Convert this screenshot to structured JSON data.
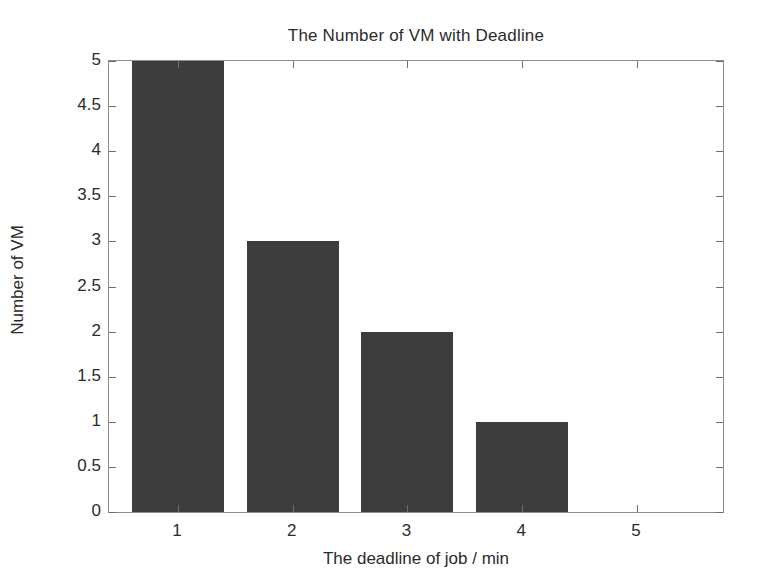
{
  "chart_data": {
    "type": "bar",
    "title": "The Number of VM with Deadline",
    "xlabel": "The deadline of job / min",
    "ylabel": "Number of VM",
    "categories": [
      "1",
      "2",
      "3",
      "4",
      "5"
    ],
    "values": [
      5,
      3,
      2,
      1,
      0
    ],
    "x": [
      1,
      2,
      3,
      4,
      5
    ],
    "xlim": [
      0.4,
      5.75
    ],
    "ylim": [
      0,
      5
    ],
    "y_ticks": [
      0,
      0.5,
      1,
      1.5,
      2,
      2.5,
      3,
      3.5,
      4,
      4.5,
      5
    ],
    "y_tick_labels": [
      "0",
      "0.5",
      "1",
      "1.5",
      "2",
      "2.5",
      "3",
      "3.5",
      "4",
      "4.5",
      "5"
    ],
    "x_ticks": [
      1,
      2,
      3,
      4,
      5
    ],
    "x_tick_labels": [
      "1",
      "2",
      "3",
      "4",
      "5"
    ],
    "grid": false,
    "legend": null,
    "bar_color": "#3d3d3d",
    "axis_color": "#8d8d8d",
    "background_color": "#ffffff",
    "bar_width_fraction": 0.8,
    "tick_direction": "in",
    "box": true
  }
}
